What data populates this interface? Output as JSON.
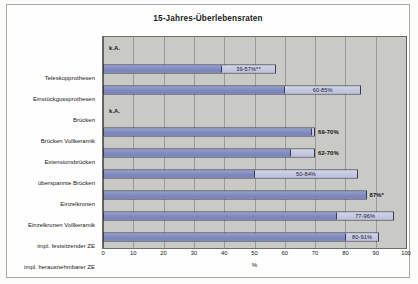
{
  "chart_data": {
    "type": "bar",
    "orientation": "horizontal",
    "title": "15-Jahres-Überlebensraten",
    "xlabel": "%",
    "ylabel": "",
    "xlim": [
      0,
      100
    ],
    "xticks": [
      "0",
      "10",
      "20",
      "30",
      "40",
      "50",
      "60",
      "70",
      "80",
      "90",
      "100"
    ],
    "grid": true,
    "legend": "none",
    "background_color": "#c9c9c6",
    "series": [
      {
        "name": "untere Rate",
        "color": "#8a94c6"
      },
      {
        "name": "obere Rate",
        "color": "#c8cbe2"
      }
    ],
    "categories": [
      "Teleskopprothesen",
      "Einstückgussprothesen",
      "Brücken",
      "Brücken Vollkeramik",
      "Extensionsbrücken",
      "überspannte Brücken",
      "Einzelkronen",
      "Einzelkronen Vollkeramik",
      "impl. festsitzender ZE",
      "impl. herausnehmbarer ZE"
    ],
    "bars": [
      {
        "category": "Teleskopprothesen",
        "low": null,
        "high": null,
        "label": "k.A.",
        "label_position": "none",
        "no_data": true
      },
      {
        "category": "Einstückgussprothesen",
        "low": 39,
        "high": 57,
        "label": "39-57%**",
        "label_position": "inside",
        "no_data": false
      },
      {
        "category": "Brücken",
        "low": 60,
        "high": 85,
        "label": "60-85%",
        "label_position": "inside",
        "no_data": false
      },
      {
        "category": "Brücken Vollkeramik",
        "low": null,
        "high": null,
        "label": "k.A.",
        "label_position": "none",
        "no_data": true
      },
      {
        "category": "Extensionsbrücken",
        "low": 69,
        "high": 70,
        "label": "69-70%",
        "label_position": "outside",
        "no_data": false
      },
      {
        "category": "überspannte Brücken",
        "low": 62,
        "high": 70,
        "label": "62-70%",
        "label_position": "outside",
        "no_data": false
      },
      {
        "category": "Einzelkronen",
        "low": 50,
        "high": 84,
        "label": "50-84%",
        "label_position": "inside",
        "no_data": false
      },
      {
        "category": "Einzelkronen Vollkeramik",
        "low": 87,
        "high": 87,
        "label": "87%*",
        "label_position": "outside",
        "no_data": false
      },
      {
        "category": "impl. festsitzender ZE",
        "low": 77,
        "high": 96,
        "label": "77-96%",
        "label_position": "inside",
        "no_data": false
      },
      {
        "category": "impl. herausnehmbarer ZE",
        "low": 80,
        "high": 91,
        "label": "80-91%",
        "label_position": "inside",
        "no_data": false
      }
    ],
    "no_data_text": "k.A."
  }
}
